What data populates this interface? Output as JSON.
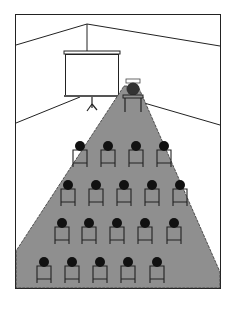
{
  "diagram": {
    "colors": {
      "frame": "#222222",
      "beam": "#8f8f8f",
      "head": "#111111",
      "chair": "#222222",
      "screen": "#ffffff",
      "projector": "#444444"
    },
    "rows": [
      {
        "y": 146,
        "xs": [
          80,
          108,
          136,
          164
        ]
      },
      {
        "y": 185,
        "xs": [
          68,
          96,
          124,
          152,
          180
        ]
      },
      {
        "y": 223,
        "xs": [
          62,
          89,
          117,
          145,
          174
        ]
      },
      {
        "y": 262,
        "xs": [
          44,
          72,
          100,
          128,
          157
        ]
      }
    ]
  }
}
